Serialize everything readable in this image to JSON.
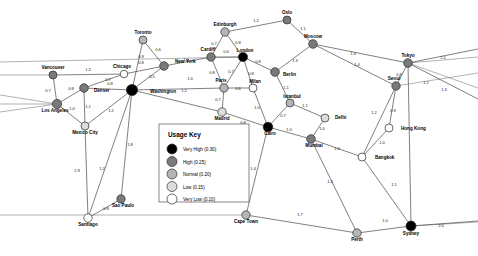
{
  "legend": {
    "title": "Usage Key",
    "items": [
      {
        "label": "Very High (0.30)",
        "color": "#000000",
        "value": 0.3
      },
      {
        "label": "High (0.25)",
        "color": "#7a7a7a",
        "value": 0.25
      },
      {
        "label": "Normal (0.20)",
        "color": "#b5b5b5",
        "value": 0.2
      },
      {
        "label": "Low (0.15)",
        "color": "#dcdcdc",
        "value": 0.15
      },
      {
        "label": "Very Low (0.10)",
        "color": "#ffffff",
        "value": 0.1
      }
    ]
  },
  "chart_data": {
    "type": "scatter",
    "title": "",
    "xlabel": "",
    "ylabel": "",
    "grid": false,
    "legend_position": "center",
    "nodes": [
      {
        "id": "vancouver",
        "label": "Vancouver",
        "x": 53,
        "y": 75,
        "usage": 0.25,
        "color": "#7a7a7a",
        "r": 4.0,
        "label_dx": 0,
        "label_dy": -6
      },
      {
        "id": "chicago",
        "label": "Chicago",
        "x": 124,
        "y": 74,
        "usage": 0.1,
        "color": "#ffffff",
        "r": 3.8,
        "label_dx": -2,
        "label_dy": -6
      },
      {
        "id": "toronto",
        "label": "Toronto",
        "x": 143,
        "y": 40,
        "usage": 0.2,
        "color": "#b5b5b5",
        "r": 4.0,
        "label_dx": 0,
        "label_dy": -6
      },
      {
        "id": "newyork",
        "label": "New York",
        "x": 164,
        "y": 66,
        "usage": 0.25,
        "color": "#7a7a7a",
        "r": 4.3,
        "label_dx": 11,
        "label_dy": -3
      },
      {
        "id": "washington",
        "label": "Washington",
        "x": 132,
        "y": 90,
        "usage": 0.3,
        "color": "#000000",
        "r": 5.6,
        "label_dx": 18,
        "label_dy": 3
      },
      {
        "id": "denver",
        "label": "Denver",
        "x": 84,
        "y": 88,
        "usage": 0.25,
        "color": "#7a7a7a",
        "r": 4.3,
        "label_dx": 10,
        "label_dy": 4
      },
      {
        "id": "losangeles",
        "label": "Los Angeles",
        "x": 57,
        "y": 104,
        "usage": 0.25,
        "color": "#7a7a7a",
        "r": 4.6,
        "label_dx": -2,
        "label_dy": 8
      },
      {
        "id": "mexicocity",
        "label": "Mexico City",
        "x": 85,
        "y": 126,
        "usage": 0.15,
        "color": "#dcdcdc",
        "r": 4.0,
        "label_dx": 0,
        "label_dy": 8
      },
      {
        "id": "santiago",
        "label": "Santiago",
        "x": 88,
        "y": 218,
        "usage": 0.1,
        "color": "#ffffff",
        "r": 4.2,
        "label_dx": 0,
        "label_dy": 8
      },
      {
        "id": "saopaulo",
        "label": "Sao Paulo",
        "x": 121,
        "y": 199,
        "usage": 0.25,
        "color": "#7a7a7a",
        "r": 4.2,
        "label_dx": 2,
        "label_dy": 8
      },
      {
        "id": "edinburgh",
        "label": "Edinburgh",
        "x": 225,
        "y": 32,
        "usage": 0.2,
        "color": "#b5b5b5",
        "r": 4.2,
        "label_dx": 0,
        "label_dy": -6
      },
      {
        "id": "oslo",
        "label": "Oslo",
        "x": 287,
        "y": 20,
        "usage": 0.25,
        "color": "#7a7a7a",
        "r": 4.0,
        "label_dx": 0,
        "label_dy": -6
      },
      {
        "id": "moscow",
        "label": "Moscow",
        "x": 313,
        "y": 44,
        "usage": 0.25,
        "color": "#7a7a7a",
        "r": 4.3,
        "label_dx": 0,
        "label_dy": -6
      },
      {
        "id": "cardiff",
        "label": "Cardiff",
        "x": 211,
        "y": 57,
        "usage": 0.25,
        "color": "#7a7a7a",
        "r": 4.2,
        "label_dx": -3,
        "label_dy": -6
      },
      {
        "id": "london",
        "label": "London",
        "x": 243,
        "y": 57,
        "usage": 0.3,
        "color": "#000000",
        "r": 4.6,
        "label_dx": 2,
        "label_dy": -5
      },
      {
        "id": "berlin",
        "label": "Berlin",
        "x": 275,
        "y": 72,
        "usage": 0.25,
        "color": "#7a7a7a",
        "r": 4.3,
        "label_dx": 8,
        "label_dy": 4
      },
      {
        "id": "paris",
        "label": "Paris",
        "x": 224,
        "y": 88,
        "usage": 0.2,
        "color": "#b5b5b5",
        "r": 4.2,
        "label_dx": -3,
        "label_dy": -6
      },
      {
        "id": "milan",
        "label": "Milan",
        "x": 253,
        "y": 88,
        "usage": 0.1,
        "color": "#ffffff",
        "r": 4.0,
        "label_dx": 2,
        "label_dy": -5
      },
      {
        "id": "madrid",
        "label": "Madrid",
        "x": 222,
        "y": 112,
        "usage": 0.15,
        "color": "#dcdcdc",
        "r": 4.2,
        "label_dx": 0,
        "label_dy": 8
      },
      {
        "id": "istanbul",
        "label": "Istanbul",
        "x": 290,
        "y": 103,
        "usage": 0.2,
        "color": "#b5b5b5",
        "r": 4.0,
        "label_dx": 2,
        "label_dy": -5
      },
      {
        "id": "cairo",
        "label": "Cairo",
        "x": 268,
        "y": 127,
        "usage": 0.3,
        "color": "#000000",
        "r": 4.8,
        "label_dx": 2,
        "label_dy": 8
      },
      {
        "id": "delhi",
        "label": "Delhi",
        "x": 325,
        "y": 118,
        "usage": 0.15,
        "color": "#dcdcdc",
        "r": 4.0,
        "label_dx": 10,
        "label_dy": 1
      },
      {
        "id": "mumbai",
        "label": "Mumbai",
        "x": 311,
        "y": 139,
        "usage": 0.25,
        "color": "#7a7a7a",
        "r": 4.3,
        "label_dx": 3,
        "label_dy": 8
      },
      {
        "id": "seoul",
        "label": "Seoul",
        "x": 396,
        "y": 86,
        "usage": 0.25,
        "color": "#7a7a7a",
        "r": 4.2,
        "label_dx": -2,
        "label_dy": -6
      },
      {
        "id": "tokyo",
        "label": "Tokyo",
        "x": 408,
        "y": 63,
        "usage": 0.25,
        "color": "#7a7a7a",
        "r": 4.3,
        "label_dx": 0,
        "label_dy": -6
      },
      {
        "id": "hongkong",
        "label": "Hong Kong",
        "x": 389,
        "y": 128,
        "usage": 0.1,
        "color": "#ffffff",
        "r": 4.0,
        "label_dx": 12,
        "label_dy": 2
      },
      {
        "id": "bangkok",
        "label": "Bangkok",
        "x": 362,
        "y": 157,
        "usage": 0.1,
        "color": "#ffffff",
        "r": 4.0,
        "label_dx": 13,
        "label_dy": 2
      },
      {
        "id": "capetown",
        "label": "Cape Town",
        "x": 246,
        "y": 215,
        "usage": 0.2,
        "color": "#b5b5b5",
        "r": 4.2,
        "label_dx": 0,
        "label_dy": 8
      },
      {
        "id": "perth",
        "label": "Perth",
        "x": 357,
        "y": 233,
        "usage": 0.2,
        "color": "#b5b5b5",
        "r": 4.2,
        "label_dx": 0,
        "label_dy": 8
      },
      {
        "id": "sydney",
        "label": "Sydney",
        "x": 411,
        "y": 226,
        "usage": 0.3,
        "color": "#000000",
        "r": 5.0,
        "label_dx": 0,
        "label_dy": 9
      }
    ],
    "edges": [
      {
        "source": "vancouver",
        "target": "chicago",
        "weight": "1.2",
        "lx": 88,
        "ly": 71
      },
      {
        "source": "vancouver",
        "target": "losangeles",
        "weight": "0.7",
        "lx": 48,
        "ly": 92
      },
      {
        "source": "chicago",
        "target": "denver",
        "weight": "0.7",
        "lx": 108,
        "ly": 81
      },
      {
        "source": "chicago",
        "target": "newyork",
        "weight": "0.8",
        "lx": 141,
        "ly": 64
      },
      {
        "source": "toronto",
        "target": "newyork",
        "weight": "0.6",
        "lx": 158,
        "ly": 51
      },
      {
        "source": "toronto",
        "target": "washington",
        "weight": "0.9",
        "lx": 141,
        "ly": 58
      },
      {
        "source": "newyork",
        "target": "washington",
        "weight": "0.5",
        "lx": 152,
        "ly": 78
      },
      {
        "source": "denver",
        "target": "washington",
        "weight": "0.8",
        "lx": 110,
        "ly": 85
      },
      {
        "source": "denver",
        "target": "losangeles",
        "weight": "0.8",
        "lx": 71,
        "ly": 90
      },
      {
        "source": "denver",
        "target": "mexicocity",
        "weight": "1.1",
        "lx": 88,
        "ly": 108
      },
      {
        "source": "losangeles",
        "target": "mexicocity",
        "weight": "1.0",
        "lx": 72,
        "ly": 110
      },
      {
        "source": "washington",
        "target": "mexicocity",
        "weight": "1.2",
        "lx": 111,
        "ly": 112
      },
      {
        "source": "washington",
        "target": "saopaulo",
        "weight": "1.8",
        "lx": 130,
        "ly": 146
      },
      {
        "source": "mexicocity",
        "target": "santiago",
        "weight": "1.9",
        "lx": 77,
        "ly": 172
      },
      {
        "source": "washington",
        "target": "santiago",
        "weight": "1.2",
        "lx": 102,
        "ly": 170
      },
      {
        "source": "santiago",
        "target": "saopaulo",
        "weight": "0.8",
        "lx": 106,
        "ly": 210
      },
      {
        "source": "newyork",
        "target": "cardiff",
        "weight": "1.0",
        "lx": 186,
        "ly": 61
      },
      {
        "source": "washington",
        "target": "paris",
        "weight": "1.2",
        "lx": 184,
        "ly": 92
      },
      {
        "source": "washington",
        "target": "madrid",
        "weight": "1.0",
        "lx": 190,
        "ly": 80
      },
      {
        "source": "edinburgh",
        "target": "cardiff",
        "weight": "0.7",
        "lx": 214,
        "ly": 45
      },
      {
        "source": "edinburgh",
        "target": "london",
        "weight": "0.8",
        "lx": 238,
        "ly": 44
      },
      {
        "source": "edinburgh",
        "target": "oslo",
        "weight": "1.2",
        "lx": 256,
        "ly": 22
      },
      {
        "source": "oslo",
        "target": "moscow",
        "weight": "1.1",
        "lx": 303,
        "ly": 30
      },
      {
        "source": "cardiff",
        "target": "london",
        "weight": "0.6",
        "lx": 226,
        "ly": 53
      },
      {
        "source": "cardiff",
        "target": "paris",
        "weight": "0.8",
        "lx": 212,
        "ly": 74
      },
      {
        "source": "london",
        "target": "paris",
        "weight": "0.7",
        "lx": 231,
        "ly": 73
      },
      {
        "source": "london",
        "target": "berlin",
        "weight": "0.8",
        "lx": 258,
        "ly": 63
      },
      {
        "source": "london",
        "target": "milan",
        "weight": "0.8",
        "lx": 251,
        "ly": 75
      },
      {
        "source": "paris",
        "target": "milan",
        "weight": "0.6",
        "lx": 238,
        "ly": 90
      },
      {
        "source": "paris",
        "target": "madrid",
        "weight": "0.7",
        "lx": 218,
        "ly": 101
      },
      {
        "source": "berlin",
        "target": "moscow",
        "weight": "1.3",
        "lx": 295,
        "ly": 62
      },
      {
        "source": "berlin",
        "target": "istanbul",
        "weight": "1.1",
        "lx": 286,
        "ly": 89
      },
      {
        "source": "milan",
        "target": "cairo",
        "weight": "1.0",
        "lx": 257,
        "ly": 109
      },
      {
        "source": "madrid",
        "target": "cairo",
        "weight": "0.8",
        "lx": 243,
        "ly": 124
      },
      {
        "source": "istanbul",
        "target": "cairo",
        "weight": "0.7",
        "lx": 283,
        "ly": 117
      },
      {
        "source": "istanbul",
        "target": "delhi",
        "weight": "1.1",
        "lx": 305,
        "ly": 107
      },
      {
        "source": "delhi",
        "target": "mumbai",
        "weight": "1.0",
        "lx": 322,
        "ly": 130
      },
      {
        "source": "cairo",
        "target": "mumbai",
        "weight": "1.0",
        "lx": 289,
        "ly": 131
      },
      {
        "source": "cairo",
        "target": "capetown",
        "weight": "1.4",
        "lx": 253,
        "ly": 170
      },
      {
        "source": "mumbai",
        "target": "bangkok",
        "weight": "1.0",
        "lx": 337,
        "ly": 150
      },
      {
        "source": "mumbai",
        "target": "perth",
        "weight": "1.4",
        "lx": 330,
        "ly": 183
      },
      {
        "source": "moscow",
        "target": "seoul",
        "weight": "1.4",
        "lx": 353,
        "ly": 55
      },
      {
        "source": "moscow",
        "target": "tokyo",
        "weight": "1.4",
        "lx": 357,
        "ly": 66
      },
      {
        "source": "seoul",
        "target": "tokyo",
        "weight": "0.8",
        "lx": 399,
        "ly": 76
      },
      {
        "source": "seoul",
        "target": "hongkong",
        "weight": "0.9",
        "lx": 393,
        "ly": 112
      },
      {
        "source": "seoul",
        "target": "bangkok",
        "weight": "1.2",
        "lx": 374,
        "ly": 114
      },
      {
        "source": "hongkong",
        "target": "bangkok",
        "weight": "1.0",
        "lx": 382,
        "ly": 144
      },
      {
        "source": "tokyo",
        "target": "sydney",
        "weight": "1.2",
        "lx": 426,
        "ly": 84
      },
      {
        "source": "bangkok",
        "target": "sydney",
        "weight": "1.1",
        "lx": 394,
        "ly": 186
      },
      {
        "source": "capetown",
        "target": "perth",
        "weight": "1.7",
        "lx": 300,
        "ly": 216
      },
      {
        "source": "perth",
        "target": "sydney",
        "weight": "1.0",
        "lx": 385,
        "ly": 222
      },
      {
        "source": "sydney",
        "target": "__east",
        "weight": "2.0",
        "lx": 441,
        "ly": 227
      },
      {
        "source": "tokyo",
        "target": "__east2",
        "weight": "1.5",
        "lx": 443,
        "ly": 59
      },
      {
        "source": "tokyo",
        "target": "__east3",
        "weight": "1.3",
        "lx": 444,
        "ly": 91
      }
    ],
    "wrap_edges": [
      {
        "from_x": 0,
        "from_y": 75,
        "to_x": 53,
        "to_y": 75
      },
      {
        "from_x": 0,
        "from_y": 95,
        "to_x": 57,
        "to_y": 104
      },
      {
        "from_x": 0,
        "from_y": 104,
        "to_x": 57,
        "to_y": 104
      },
      {
        "from_x": 0,
        "from_y": 112,
        "to_x": 57,
        "to_y": 104
      },
      {
        "from_x": 0,
        "from_y": 62,
        "to_x": 243,
        "to_y": 57
      },
      {
        "from_x": 0,
        "from_y": 215,
        "to_x": 246,
        "to_y": 215
      },
      {
        "from_x": 478,
        "from_y": 57,
        "to_x": 408,
        "to_y": 63
      },
      {
        "from_x": 478,
        "from_y": 88,
        "to_x": 408,
        "to_y": 63
      },
      {
        "from_x": 478,
        "from_y": 222,
        "to_x": 411,
        "to_y": 226
      },
      {
        "from_x": 478,
        "from_y": 73,
        "to_x": 396,
        "to_y": 86
      }
    ]
  }
}
